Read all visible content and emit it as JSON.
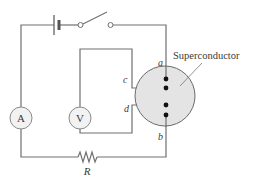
{
  "diagram": {
    "type": "circuit",
    "colors": {
      "wire": "#707070",
      "disk_fill": "#e4e4e4",
      "disk_stroke": "#6a6a6a",
      "meter_fill": "#f2f2f2",
      "dot": "#111111",
      "text": "#3a3a3a"
    },
    "components": {
      "battery": {
        "label": ""
      },
      "switch": {
        "state": "open"
      },
      "ammeter": {
        "symbol": "A"
      },
      "voltmeter": {
        "symbol": "V"
      },
      "resistor": {
        "label": "R"
      },
      "superconductor": {
        "label": "Superconductor"
      }
    },
    "contacts": {
      "a": "a",
      "b": "b",
      "c": "c",
      "d": "d"
    }
  }
}
